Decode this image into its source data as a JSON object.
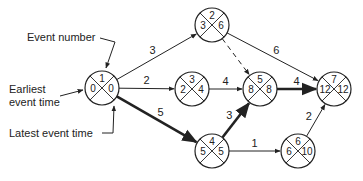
{
  "annotations": {
    "event_number": "Event number",
    "earliest_line1": "Earliest",
    "earliest_line2": "event time",
    "latest": "Latest event time"
  },
  "nodes": [
    {
      "id": 1,
      "event": "1",
      "earliest": "0",
      "latest": "0",
      "cx": 102,
      "cy": 88
    },
    {
      "id": 2,
      "event": "2",
      "earliest": "3",
      "latest": "6",
      "cx": 212,
      "cy": 25
    },
    {
      "id": 3,
      "event": "3",
      "earliest": "2",
      "latest": "4",
      "cx": 192,
      "cy": 89
    },
    {
      "id": 4,
      "event": "4",
      "earliest": "5",
      "latest": "5",
      "cx": 212,
      "cy": 151
    },
    {
      "id": 5,
      "event": "5",
      "earliest": "8",
      "latest": "8",
      "cx": 260,
      "cy": 89
    },
    {
      "id": 6,
      "event": "6",
      "earliest": "6",
      "latest": "10",
      "cx": 298,
      "cy": 151
    },
    {
      "id": 7,
      "event": "7",
      "earliest": "12",
      "latest": "12",
      "cx": 334,
      "cy": 89
    }
  ],
  "edges": [
    {
      "from": 1,
      "to": 2,
      "duration": "3",
      "critical": false,
      "dummy": false
    },
    {
      "from": 1,
      "to": 3,
      "duration": "2",
      "critical": false,
      "dummy": false
    },
    {
      "from": 1,
      "to": 4,
      "duration": "5",
      "critical": true,
      "dummy": false
    },
    {
      "from": 2,
      "to": 5,
      "duration": "",
      "critical": false,
      "dummy": true
    },
    {
      "from": 2,
      "to": 7,
      "duration": "6",
      "critical": false,
      "dummy": false
    },
    {
      "from": 3,
      "to": 5,
      "duration": "4",
      "critical": false,
      "dummy": false
    },
    {
      "from": 4,
      "to": 5,
      "duration": "3",
      "critical": true,
      "dummy": false
    },
    {
      "from": 4,
      "to": 6,
      "duration": "1",
      "critical": false,
      "dummy": false
    },
    {
      "from": 5,
      "to": 7,
      "duration": "4",
      "critical": true,
      "dummy": false
    },
    {
      "from": 6,
      "to": 7,
      "duration": "2",
      "critical": false,
      "dummy": false
    }
  ]
}
